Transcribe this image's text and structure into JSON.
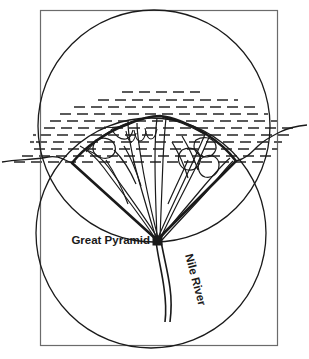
{
  "figure": {
    "background_color": "#ffffff",
    "line_color": "#1a1a1a",
    "sea_hatch_color": "#5a5a5a",
    "frame_color": "#6b6b6b"
  },
  "labels": {
    "great_pyramid": "Great Pyramid",
    "nile_river": "Nile River"
  },
  "geometry": {
    "frame": {
      "x": 40,
      "y": 10,
      "width": 237,
      "height": 335
    },
    "upper_circle": {
      "cx": 154,
      "cy": 126,
      "r": 116
    },
    "lower_circle": {
      "cx": 151,
      "cy": 233,
      "r": 115
    },
    "apex_marker": {
      "cx": 157,
      "cy": 240,
      "size": 8
    },
    "wedge_left_endpoint": {
      "x": 72,
      "y": 163
    },
    "wedge_right_endpoint": {
      "x": 236,
      "y": 161
    }
  },
  "elements": {
    "upper_circle_name": "upper-circle",
    "lower_circle_name": "lower-circle",
    "frame_name": "outer-frame",
    "delta_fan_name": "nile-delta-fan",
    "sea_name": "mediterranean-sea-hatching",
    "coastline_name": "coastline",
    "river_name": "nile-river-channel",
    "marker_name": "great-pyramid-marker"
  }
}
